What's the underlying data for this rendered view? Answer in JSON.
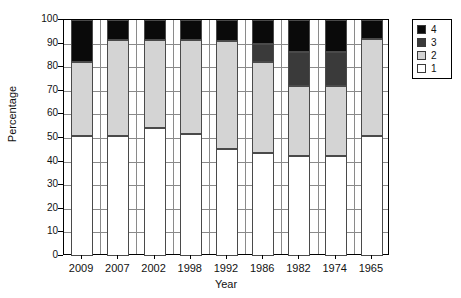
{
  "chart_data": {
    "type": "bar",
    "stacked": true,
    "title": "",
    "xlabel": "Year",
    "ylabel": "Percentage",
    "ylim": [
      0,
      100
    ],
    "ytick_step": 10,
    "yticks": [
      0,
      10,
      20,
      30,
      40,
      50,
      60,
      70,
      80,
      90,
      100
    ],
    "ytick_labels": [
      "0",
      "10",
      "20",
      "30",
      "40",
      "50",
      "60",
      "70",
      "80",
      "90",
      "100"
    ],
    "grid": true,
    "legend_position": "right",
    "categories": [
      "2009",
      "2007",
      "2002",
      "1998",
      "1992",
      "1986",
      "1982",
      "1974",
      "1965"
    ],
    "series": [
      {
        "name": "1",
        "color": "#ffffff",
        "values": [
          50.8,
          50.8,
          54.2,
          51.7,
          45.5,
          43.6,
          42.4,
          42.4,
          50.8
        ]
      },
      {
        "name": "2",
        "color": "#d4d4d4",
        "values": [
          31.2,
          40.7,
          37.3,
          39.8,
          45.5,
          38.4,
          29.6,
          29.6,
          41.2
        ]
      },
      {
        "name": "3",
        "color": "#3a3a3a",
        "values": [
          0.0,
          0.0,
          0.0,
          0.0,
          0.0,
          8.0,
          14.4,
          14.4,
          0.0
        ]
      },
      {
        "name": "4",
        "color": "#0a0a0a",
        "values": [
          18.0,
          8.5,
          8.5,
          8.5,
          9.0,
          10.0,
          13.6,
          13.6,
          8.0
        ]
      }
    ],
    "cumulative_tops": [
      {
        "year": "2009",
        "lvl1": 50.8,
        "lvl2": 82.0,
        "lvl3": 82.0,
        "lvl4": 100
      },
      {
        "year": "2007",
        "lvl1": 50.8,
        "lvl2": 91.5,
        "lvl3": 91.5,
        "lvl4": 100
      },
      {
        "year": "2002",
        "lvl1": 54.2,
        "lvl2": 91.5,
        "lvl3": 91.5,
        "lvl4": 100
      },
      {
        "year": "1998",
        "lvl1": 51.7,
        "lvl2": 91.5,
        "lvl3": 91.5,
        "lvl4": 100
      },
      {
        "year": "1992",
        "lvl1": 45.5,
        "lvl2": 91.0,
        "lvl3": 91.0,
        "lvl4": 100
      },
      {
        "year": "1986",
        "lvl1": 43.6,
        "lvl2": 82.0,
        "lvl3": 90.0,
        "lvl4": 100
      },
      {
        "year": "1982",
        "lvl1": 42.4,
        "lvl2": 72.0,
        "lvl3": 86.4,
        "lvl4": 100
      },
      {
        "year": "1974",
        "lvl1": 42.4,
        "lvl2": 72.0,
        "lvl3": 86.4,
        "lvl4": 100
      },
      {
        "year": "1965",
        "lvl1": 50.8,
        "lvl2": 92.0,
        "lvl3": 92.0,
        "lvl4": 100
      }
    ],
    "legend": {
      "entries": [
        {
          "label": "4",
          "color": "#0a0a0a"
        },
        {
          "label": "3",
          "color": "#3a3a3a"
        },
        {
          "label": "2",
          "color": "#d4d4d4"
        },
        {
          "label": "1",
          "color": "#ffffff"
        }
      ]
    }
  }
}
